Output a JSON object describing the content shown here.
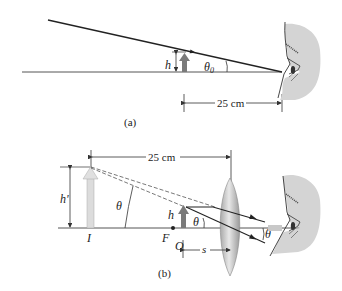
{
  "figure_a": {
    "caption": "(a)",
    "object_height_label": "h",
    "angle_label": "θ",
    "angle_subscript": "0",
    "distance_label": "25 cm"
  },
  "figure_b": {
    "caption": "(b)",
    "distance_label": "25 cm",
    "image_height_label": "h'",
    "object_height_label": "h",
    "angle_label_left": "θ",
    "angle_label_lens": "θ",
    "angle_label_eye": "θ",
    "image_label": "I",
    "focal_point_label": "F",
    "object_label": "O",
    "object_distance_label": "s"
  },
  "colors": {
    "line": "#333333",
    "object_arrow": "#7a7a7a",
    "image_arrow": "#d9d9d9",
    "face": "#d4d4d4",
    "lens": "#c8c8c8"
  }
}
